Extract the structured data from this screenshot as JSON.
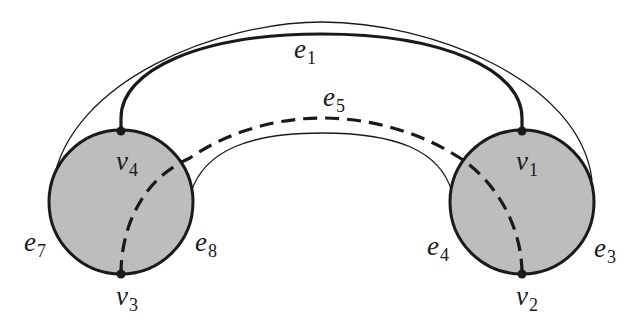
{
  "diagram": {
    "title": "",
    "colors": {
      "disk_fill": "#bdbdbd",
      "stroke": "#1a1a1a",
      "background": "#ffffff"
    },
    "vertices": [
      {
        "id": "v1",
        "base": "v",
        "sub": "1"
      },
      {
        "id": "v2",
        "base": "v",
        "sub": "2"
      },
      {
        "id": "v3",
        "base": "v",
        "sub": "3"
      },
      {
        "id": "v4",
        "base": "v",
        "sub": "4"
      }
    ],
    "edges": [
      {
        "id": "e1",
        "base": "e",
        "sub": "1",
        "style": "thick solid",
        "connects": [
          "v4",
          "v1"
        ]
      },
      {
        "id": "e5",
        "base": "e",
        "sub": "5",
        "style": "dashed",
        "connects": [
          "v3",
          "v2"
        ]
      },
      {
        "id": "e7",
        "base": "e",
        "sub": "7",
        "style": "circle arc",
        "connects": [
          "v4",
          "v3"
        ]
      },
      {
        "id": "e8",
        "base": "e",
        "sub": "8",
        "style": "circle arc",
        "connects": [
          "v4",
          "v3"
        ]
      },
      {
        "id": "e4",
        "base": "e",
        "sub": "4",
        "style": "circle arc",
        "connects": [
          "v1",
          "v2"
        ]
      },
      {
        "id": "e3",
        "base": "e",
        "sub": "3",
        "style": "circle arc",
        "connects": [
          "v1",
          "v2"
        ]
      }
    ]
  }
}
